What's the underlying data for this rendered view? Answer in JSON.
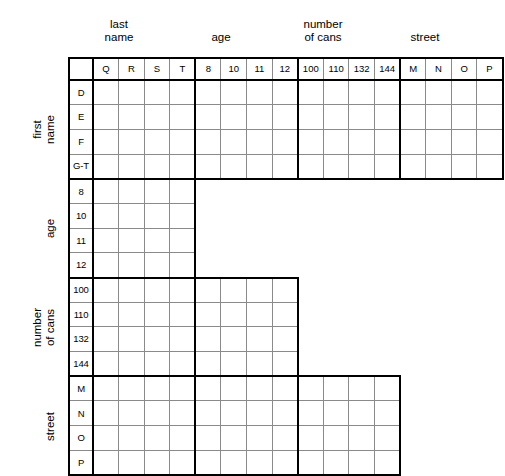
{
  "puzzle": {
    "type": "logic-grid",
    "column_groups": [
      {
        "caption": "last\nname",
        "caption_line1": "last",
        "caption_line2": "name",
        "items": [
          "Q",
          "R",
          "S",
          "T"
        ]
      },
      {
        "caption": "age",
        "caption_line1": "age",
        "caption_line2": "",
        "items": [
          "8",
          "10",
          "11",
          "12"
        ]
      },
      {
        "caption": "number\nof cans",
        "caption_line1": "number",
        "caption_line2": "of cans",
        "items": [
          "100",
          "110",
          "132",
          "144"
        ]
      },
      {
        "caption": "street",
        "caption_line1": "street",
        "caption_line2": "",
        "items": [
          "M",
          "N",
          "O",
          "P"
        ]
      }
    ],
    "row_groups": [
      {
        "caption_line1": "first",
        "caption_line2": "name",
        "items": [
          "D",
          "E",
          "F",
          "G-T"
        ],
        "span_columns": 16
      },
      {
        "caption_line1": "age",
        "caption_line2": "",
        "items": [
          "8",
          "10",
          "11",
          "12"
        ],
        "span_columns": 4
      },
      {
        "caption_line1": "number",
        "caption_line2": "of cans",
        "items": [
          "100",
          "110",
          "132",
          "144"
        ],
        "span_columns": 8
      },
      {
        "caption_line1": "street",
        "caption_line2": "",
        "items": [
          "M",
          "N",
          "O",
          "P"
        ],
        "span_columns": 12
      }
    ],
    "cells": [],
    "colors": {
      "grid_line": "#8a8a8a",
      "group_line": "#000000",
      "background": "#ffffff"
    }
  }
}
